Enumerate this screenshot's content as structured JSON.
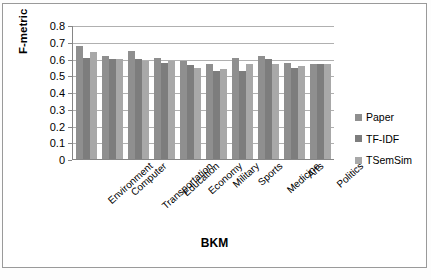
{
  "chart_data": {
    "type": "bar",
    "title": "",
    "xlabel": "BKM",
    "ylabel": "F-metric",
    "ylim": [
      0,
      0.8
    ],
    "ytick_labels": [
      "0.8",
      "0.7",
      "0.6",
      "0.5",
      "0.4",
      "0.3",
      "0.2",
      "0.1",
      "0"
    ],
    "ytick_values": [
      0.8,
      0.7,
      0.6,
      0.5,
      0.4,
      0.3,
      0.2,
      0.1,
      0
    ],
    "grid": true,
    "legend_position": "right",
    "categories": [
      "Environment",
      "Computer",
      "Transportation",
      "Education",
      "Economy",
      "Military",
      "Sports",
      "Medicine",
      "Arts",
      "Politics"
    ],
    "series": [
      {
        "name": "Paper",
        "color": "#8f8f8f",
        "values": [
          0.675,
          0.615,
          0.645,
          0.605,
          0.585,
          0.565,
          0.605,
          0.615,
          0.575,
          0.57
        ]
      },
      {
        "name": "TF-IDF",
        "color": "#7d7d7d",
        "values": [
          0.605,
          0.6,
          0.6,
          0.575,
          0.56,
          0.525,
          0.525,
          0.6,
          0.545,
          0.565
        ]
      },
      {
        "name": "TSemSim",
        "color": "#a8a8a8",
        "values": [
          0.64,
          0.6,
          0.585,
          0.585,
          0.545,
          0.535,
          0.565,
          0.565,
          0.555,
          0.565
        ]
      }
    ]
  },
  "legend": {
    "items": [
      {
        "label": "Paper",
        "color": "#8f8f8f"
      },
      {
        "label": "TF-IDF",
        "color": "#7d7d7d"
      },
      {
        "label": "TSemSim",
        "color": "#a8a8a8"
      }
    ]
  }
}
